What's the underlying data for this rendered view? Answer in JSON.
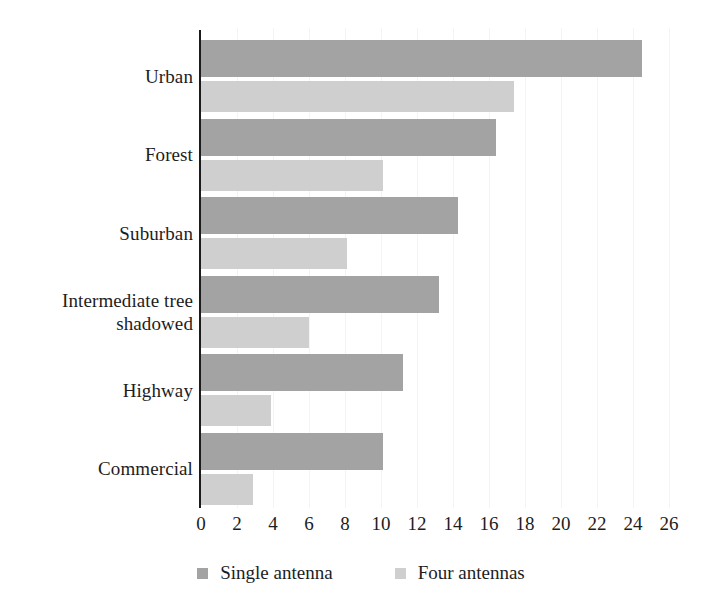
{
  "chart_data": {
    "type": "bar",
    "orientation": "horizontal",
    "title": "",
    "subtitle": "",
    "xlabel": "",
    "ylabel": "",
    "xlim": [
      0,
      26
    ],
    "ylim": null,
    "grid": true,
    "grid_axis": "x",
    "legend_position": "bottom-center",
    "categories": [
      "Urban",
      "Forest",
      "Suburban",
      "Intermediate tree shadowed",
      "Highway",
      "Commercial"
    ],
    "category_label_lines": [
      [
        "Urban"
      ],
      [
        "Forest"
      ],
      [
        "Suburban"
      ],
      [
        "Intermediate tree",
        "shadowed"
      ],
      [
        "Highway"
      ],
      [
        "Commercial"
      ]
    ],
    "series": [
      {
        "name": "Single antenna",
        "color": "#a3a3a3",
        "values": [
          24.5,
          16.4,
          14.3,
          13.2,
          11.2,
          10.1
        ]
      },
      {
        "name": "Four antennas",
        "color": "#cfcfcf",
        "values": [
          17.4,
          10.1,
          8.1,
          6.0,
          3.9,
          2.9
        ]
      }
    ],
    "xticks": [
      0,
      2,
      4,
      6,
      8,
      10,
      12,
      14,
      16,
      18,
      20,
      22,
      24,
      26
    ],
    "xtick_labels": [
      "0",
      "2",
      "4",
      "6",
      "8",
      "10",
      "12",
      "14",
      "16",
      "18",
      "20",
      "22",
      "24",
      "26"
    ],
    "axis_color": "#1b1b1b",
    "grid_color": "#f4f4f4",
    "background_color": "#ffffff"
  },
  "legend": {
    "items": [
      {
        "label": "Single antenna",
        "color": "#a3a3a3"
      },
      {
        "label": "Four antennas",
        "color": "#cfcfcf"
      }
    ]
  }
}
